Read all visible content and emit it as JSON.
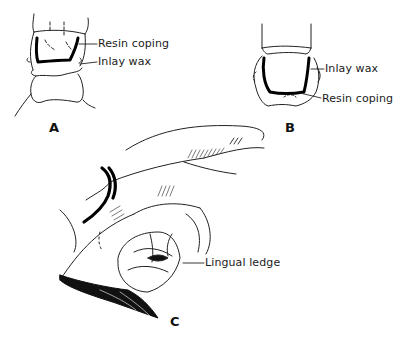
{
  "figure": {
    "panels": [
      {
        "id": "A",
        "letter": "A",
        "labels": [
          "Resin coping",
          "Inlay wax"
        ]
      },
      {
        "id": "B",
        "letter": "B",
        "labels": [
          "Inlay wax",
          "Resin coping"
        ]
      },
      {
        "id": "C",
        "letter": "C",
        "labels": [
          "Lingual ledge"
        ]
      }
    ],
    "colors": {
      "ink": "#111111",
      "background": "#ffffff"
    }
  }
}
